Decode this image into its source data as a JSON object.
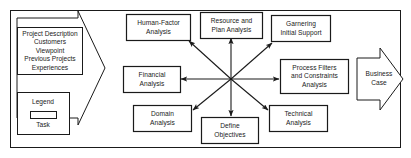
{
  "diagram": {
    "frame": {
      "stroke": "#1a1a1a"
    },
    "input_arrow": {
      "name": "project-description-input",
      "lines": [
        "Project Description",
        "Customers",
        "Viewpoint",
        "Previous Projects",
        "Experiences"
      ]
    },
    "output_arrow": {
      "name": "business-case-output",
      "lines": [
        "Business",
        "Case"
      ]
    },
    "legend": {
      "title": "Legend",
      "swatch_label": "Task",
      "swatch_shape": "rectangle"
    },
    "hub": {
      "x": 231,
      "y": 79
    },
    "tasks": [
      {
        "id": "human-factor-analysis",
        "lines": [
          "Human-Factor",
          "Analysis"
        ]
      },
      {
        "id": "resource-and-plan-analysis",
        "lines": [
          "Resource and",
          "Plan Analysis"
        ]
      },
      {
        "id": "garnering-initial-support",
        "lines": [
          "Garnering",
          "Initial Support"
        ]
      },
      {
        "id": "process-filters-and-constraints-analysis",
        "lines": [
          "Process Filters",
          "and Constraints",
          "Analysis"
        ]
      },
      {
        "id": "technical-analysis",
        "lines": [
          "Technical",
          "Analysis"
        ]
      },
      {
        "id": "define-objectives",
        "lines": [
          "Define",
          "Objectives"
        ]
      },
      {
        "id": "domain-analysis",
        "lines": [
          "Domain",
          "Analysis"
        ]
      },
      {
        "id": "financial-analysis",
        "lines": [
          "Financial",
          "Analysis"
        ]
      }
    ]
  }
}
